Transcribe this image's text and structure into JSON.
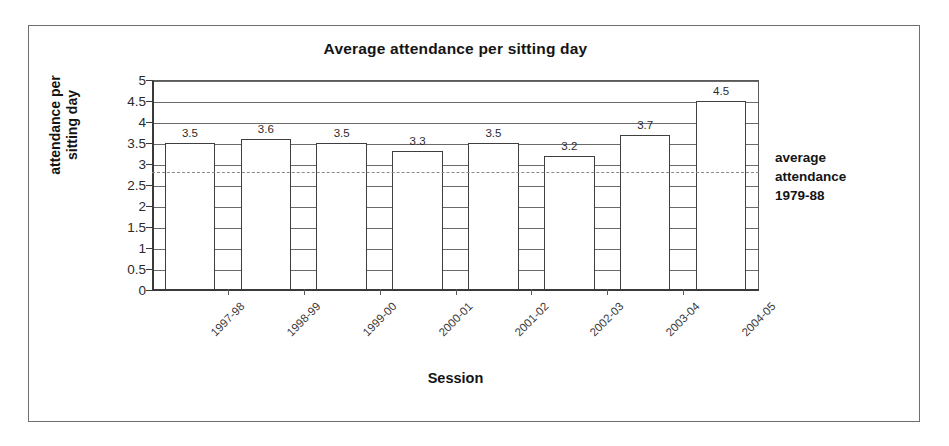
{
  "chart_data": {
    "type": "bar",
    "title": "Average attendance per sitting day",
    "xlabel": "Session",
    "ylabel": "attendance per sitting day",
    "ylabel_line1": "attendance per",
    "ylabel_line2": "sitting day",
    "categories": [
      "1997-98",
      "1998-99",
      "1999-00",
      "2000-01",
      "2001-02",
      "2002-03",
      "2003-04",
      "2004-05"
    ],
    "values": [
      3.5,
      3.6,
      3.5,
      3.3,
      3.5,
      3.2,
      3.7,
      4.5
    ],
    "data_labels": [
      "3.5",
      "3.6",
      "3.5",
      "3.3",
      "3.5",
      "3.2",
      "3.7",
      "4.5"
    ],
    "ylim": [
      0,
      5
    ],
    "ytick_step": 0.5,
    "ytick_labels": [
      "5",
      "4.5",
      "4",
      "3.5",
      "3",
      "2.5",
      "2",
      "1.5",
      "1",
      "0.5",
      "0"
    ],
    "ytick_values": [
      5,
      4.5,
      4,
      3.5,
      3,
      2.5,
      2,
      1.5,
      1,
      0.5,
      0
    ],
    "grid": true,
    "grid_axis": "y",
    "legend_position": "right",
    "reference_line": {
      "label_line1": "average",
      "label_line2": "attendance",
      "label_line3": "1979-88",
      "value": 2.8,
      "style": "dashed",
      "color": "#8a8a8a"
    },
    "series_name": "Average attendance per sitting day",
    "bar_fill_color": "#ffffff",
    "bar_edge_color": "#3f3f3f",
    "axis_color": "#3a3a3a",
    "grid_color": "#6a6a6a",
    "background_color": "#ffffff",
    "frame_color": "#6e6e6e"
  }
}
